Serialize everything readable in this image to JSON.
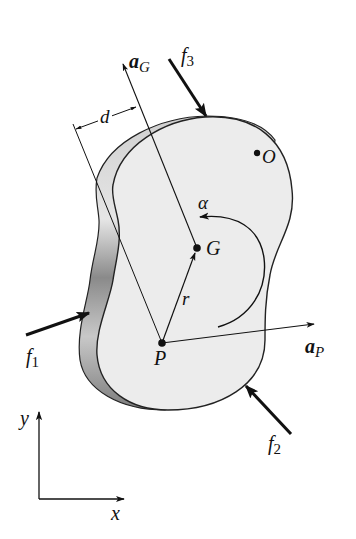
{
  "figure": {
    "type": "rigid-body-kinetics-diagram",
    "body": {
      "fill": "#ececec",
      "edge_fill": "#bdbdbd",
      "stroke": "#222222"
    },
    "points": {
      "G": {
        "label": "G",
        "x": 197,
        "y": 248
      },
      "P": {
        "label": "P",
        "x": 162,
        "y": 343
      },
      "O": {
        "label": "O",
        "x": 257,
        "y": 153
      }
    },
    "vectors": {
      "aG": {
        "label_main": "a",
        "label_sub": "G"
      },
      "aP": {
        "label_main": "a",
        "label_sub": "P"
      },
      "r": {
        "label": "r"
      },
      "alpha": {
        "label": "α"
      }
    },
    "forces": [
      {
        "id": "f1",
        "label_main": "f",
        "label_sub": "1"
      },
      {
        "id": "f2",
        "label_main": "f",
        "label_sub": "2"
      },
      {
        "id": "f3",
        "label_main": "f",
        "label_sub": "3"
      }
    ],
    "dimension": {
      "label": "d"
    },
    "axes": {
      "x_label": "x",
      "y_label": "y"
    }
  }
}
